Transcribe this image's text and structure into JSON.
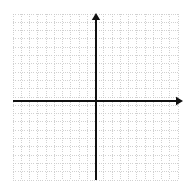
{
  "figure": {
    "width": 189,
    "height": 190,
    "background_color": "#ffffff"
  },
  "chart_data": {
    "type": "scatter",
    "title": "",
    "subtitle": "",
    "xlabel": "",
    "ylabel": "",
    "x": [],
    "y": [],
    "series": [],
    "annotations": [],
    "legend": [],
    "legend_position": "none",
    "grid": true,
    "grid_style": "dotted",
    "grid_color": "#c9c9c9",
    "grid_spacing_px": 8.25,
    "cells_x": 20,
    "cells_y": 20,
    "xlim": [
      -10,
      10
    ],
    "ylim": [
      -10.5,
      9.5
    ],
    "xticks": [],
    "yticks": [],
    "tick_labels_visible": false,
    "axis_color": "#111111",
    "axes": {
      "x_axis": {
        "label": "x",
        "arrow_positive": true,
        "arrow_negative": false,
        "origin_y_px": 101,
        "start_x_px": 13,
        "end_x_px": 183
      },
      "y_axis": {
        "label": "y",
        "arrow_positive": true,
        "arrow_negative": false,
        "origin_x_px": 96,
        "start_y_px": 180,
        "end_y_px": 13
      }
    },
    "grid_bounds_px": {
      "left": 13,
      "top": 14,
      "right": 178,
      "bottom": 180
    }
  }
}
